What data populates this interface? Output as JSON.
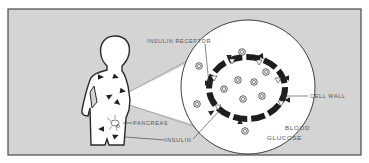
{
  "diagram": {
    "colors": {
      "background": "#d4d4d4",
      "frame": "#4a4a4a",
      "figure_fill": "#ffffff",
      "ink": "#2a2a2a",
      "label": "#555555"
    },
    "labels": {
      "insulin_receptor": "INSULIN RECEPTOR",
      "cell_wall": "CELL WALL",
      "pancreas": "PANCREAS",
      "insulin": "INSULIN",
      "blood": "BLOOD",
      "glucose": "GLUCOSE"
    },
    "elements": {
      "body": "human-silhouette",
      "magnifier": "magnified-blood-view",
      "cell": "cell-membrane-ring",
      "glucose_symbol": "G"
    },
    "body_insulin_marker_count": 7,
    "glucose_inside_cell_count": 5,
    "glucose_outside_cell_count": 5,
    "receptor_count": 6
  }
}
